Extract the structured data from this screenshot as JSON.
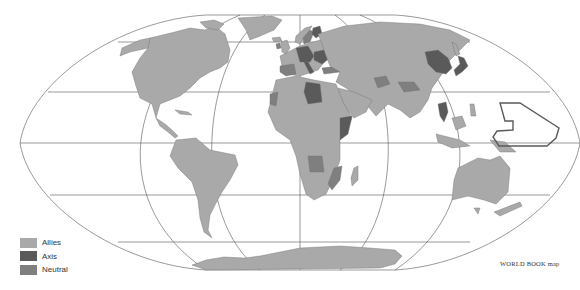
{
  "map": {
    "title": "World alignment map",
    "projection": "elliptical (Mollweide-like)",
    "colors": {
      "allies": "#a9a9a9",
      "axis": "#5a5a5a",
      "neutral": "#7f7f7f",
      "outline": "#555555",
      "background": "#ffffff"
    }
  },
  "legend": {
    "items": [
      {
        "label": "Allies",
        "color": "#a9a9a9"
      },
      {
        "label": "Axis",
        "color": "#5a5a5a"
      },
      {
        "label": "Neutral",
        "color": "#7f7f7f"
      }
    ]
  },
  "credit": "WORLD BOOK map",
  "regions": {
    "allies": [
      "North America",
      "South America",
      "Soviet Union",
      "China",
      "India",
      "Africa (most)",
      "Australia",
      "Antarctica",
      "United Kingdom",
      "Middle East"
    ],
    "axis": [
      "Germany",
      "Italy",
      "Japan",
      "Japanese-occupied China",
      "Libya",
      "Thailand",
      "Finland",
      "Romania",
      "Hungary",
      "Bulgaria",
      "Italian East Africa"
    ],
    "neutral": [
      "Spain",
      "Portugal",
      "Sweden",
      "Switzerland",
      "Ireland",
      "Turkey",
      "Afghanistan",
      "Tibet",
      "Angola",
      "Mozambique",
      "Spanish Sahara",
      "Saudi Arabia"
    ],
    "outlined": [
      "Japanese Pacific mandate"
    ]
  }
}
